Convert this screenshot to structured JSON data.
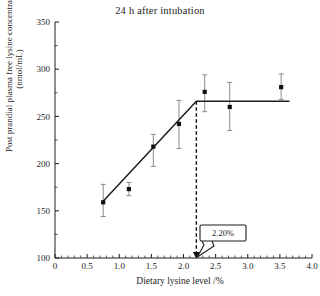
{
  "chart_data": {
    "type": "scatter",
    "title": "24 h after intubation",
    "xlabel": "Dietary lysine level /%",
    "ylabel_line1": "Post prandial plasma free lysine concentration",
    "ylabel_line2": "(nmol/mL)",
    "xlim": [
      0,
      4.0
    ],
    "ylim": [
      100,
      350
    ],
    "xticks": [
      "0",
      "0.5",
      "1.0",
      "1.5",
      "2.0",
      "2.5",
      "3.0",
      "3.5",
      "4.0"
    ],
    "xtick_values": [
      0,
      0.5,
      1.0,
      1.5,
      2.0,
      2.5,
      3.0,
      3.5,
      4.0
    ],
    "yticks": [
      "100",
      "150",
      "200",
      "250",
      "300",
      "350"
    ],
    "ytick_values": [
      100,
      150,
      200,
      250,
      300,
      350
    ],
    "x_minor_step": 0.1,
    "y_minor_step": 25,
    "grid": false,
    "legend": "none",
    "x": [
      0.75,
      1.15,
      1.53,
      1.93,
      2.33,
      2.72,
      3.52
    ],
    "values": [
      159,
      173,
      218,
      242,
      276,
      260,
      281
    ],
    "error_low": [
      144,
      166,
      197,
      216,
      255,
      235,
      268
    ],
    "error_high": [
      178,
      180,
      231,
      267,
      294,
      286,
      295
    ],
    "fit": {
      "type": "broken-line-plateau",
      "breakpoint_x": 2.2,
      "plateau_y": 266,
      "segment1_start": [
        0.72,
        158
      ],
      "segment1_end": [
        2.2,
        266
      ],
      "segment2_end": [
        3.65,
        266
      ]
    },
    "annotations": [
      {
        "label": "2.20%",
        "points_to_x": 2.2,
        "points_to_y": 100,
        "style": "callout-box-with-arrow"
      }
    ],
    "colors": {
      "axis": "#1d1d1d",
      "marker": "#111111",
      "errorbar": "#8a8a8a",
      "fit_line": "#1d1d1d",
      "dashed_drop": "#111111",
      "callout_border": "#1d1d1d"
    }
  }
}
